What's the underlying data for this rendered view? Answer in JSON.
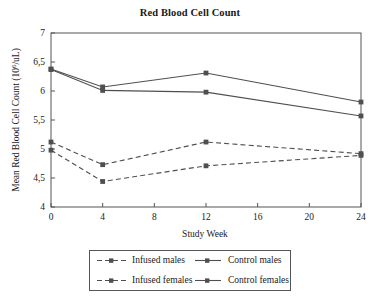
{
  "chart_data": {
    "type": "line",
    "title": "Red Blood Cell Count",
    "xlabel": "Study Week",
    "ylabel": "Mean Red Blood Cell Count (10⁶/uL)",
    "ylabel_prefix": "Mean Red Blood Cell Count (10",
    "ylabel_superscript": "6",
    "ylabel_suffix": "/uL)",
    "x": [
      0,
      4,
      12,
      24
    ],
    "xlim": [
      0,
      24
    ],
    "ylim": [
      4,
      7
    ],
    "xticks": [
      "0",
      "4",
      "8",
      "12",
      "16",
      "20",
      "24"
    ],
    "xtick_values": [
      0,
      4,
      8,
      12,
      16,
      20,
      24
    ],
    "yticks": [
      "4",
      "4,5",
      "5",
      "5,5",
      "6",
      "6,5",
      "7"
    ],
    "ytick_values": [
      4,
      4.5,
      5,
      5.5,
      6,
      6.5,
      7
    ],
    "grid": false,
    "legend_position": "below",
    "series": [
      {
        "name": "Infused males",
        "values": [
          5.12,
          4.73,
          5.12,
          4.92
        ],
        "style": "dashed",
        "marker": "square",
        "color": "#4f4f4f"
      },
      {
        "name": "Infused females",
        "values": [
          4.98,
          4.44,
          4.71,
          4.89
        ],
        "style": "dashed",
        "marker": "square",
        "color": "#4f4f4f"
      },
      {
        "name": "Control males",
        "values": [
          6.38,
          6.07,
          6.31,
          5.81
        ],
        "style": "solid",
        "marker": "square",
        "color": "#4f4f4f"
      },
      {
        "name": "Control females",
        "values": [
          6.37,
          6.01,
          5.98,
          5.57
        ],
        "style": "solid",
        "marker": "square",
        "color": "#4f4f4f"
      }
    ]
  },
  "legend": {
    "rows": [
      {
        "left": "Infused males",
        "right": "Control males"
      },
      {
        "left": "Infused females",
        "right": "Control females"
      }
    ]
  },
  "colors": {
    "axis": "#555555",
    "line": "#4f4f4f",
    "text": "#1a1a1a",
    "background": "#ffffff"
  }
}
